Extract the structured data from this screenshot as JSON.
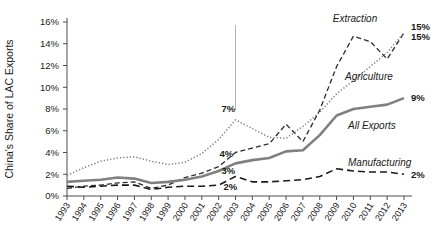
{
  "chart_data": {
    "type": "line",
    "title": "",
    "xlabel": "",
    "ylabel": "China's Share of LAC Exports",
    "x": [
      1993,
      1994,
      1995,
      1996,
      1997,
      1998,
      1999,
      2000,
      2001,
      2002,
      2003,
      2004,
      2005,
      2006,
      2007,
      2008,
      2009,
      2010,
      2011,
      2012,
      2013
    ],
    "xtick_labels": [
      "1993",
      "1994",
      "1995",
      "1996",
      "1997",
      "1998",
      "1999",
      "2000",
      "2001",
      "2002",
      "2003",
      "2004",
      "2005",
      "2006",
      "2007",
      "2008",
      "2009",
      "2010",
      "2011",
      "2012",
      "2013"
    ],
    "ytick_labels": [
      "0%",
      "2%",
      "4%",
      "6%",
      "8%",
      "10%",
      "12%",
      "14%",
      "16%"
    ],
    "ytick_values": [
      0,
      2,
      4,
      6,
      8,
      10,
      12,
      14,
      16
    ],
    "ylim": [
      0,
      16
    ],
    "xlim": [
      1993,
      2013
    ],
    "grid": false,
    "legend_position": "inline-right",
    "series": [
      {
        "name": "Extraction",
        "style": "dashed-medium",
        "color": "#2b2b2b",
        "label_text": "Extraction",
        "end_value_label": "15%",
        "values": [
          0.7,
          0.9,
          1.0,
          1.2,
          1.3,
          0.7,
          1.0,
          1.7,
          2.1,
          2.7,
          4.0,
          4.4,
          4.8,
          6.6,
          5.0,
          7.9,
          11.9,
          14.7,
          14.2,
          12.6,
          15.0
        ]
      },
      {
        "name": "Agriculture",
        "style": "dotted",
        "color": "#808080",
        "label_text": "Agriculture",
        "end_value_label": "15%",
        "values": [
          1.9,
          2.6,
          3.2,
          3.5,
          3.6,
          3.2,
          2.9,
          3.1,
          3.9,
          5.2,
          7.0,
          6.2,
          5.4,
          5.3,
          6.4,
          7.7,
          9.4,
          10.6,
          11.9,
          13.2,
          15.0
        ]
      },
      {
        "name": "All Exports",
        "style": "solid-thick",
        "color": "#808080",
        "label_text": "All Exports",
        "end_value_label": "9%",
        "values": [
          1.3,
          1.4,
          1.5,
          1.7,
          1.6,
          1.2,
          1.3,
          1.5,
          1.8,
          2.3,
          3.0,
          3.3,
          3.5,
          4.1,
          4.2,
          5.6,
          7.4,
          8.0,
          8.2,
          8.4,
          9.0
        ]
      },
      {
        "name": "Manufacturing",
        "style": "dashed-long",
        "color": "#1a1a1a",
        "label_text": "Manufacturing",
        "end_value_label": "2%",
        "values": [
          0.9,
          0.8,
          0.9,
          1.0,
          1.0,
          0.6,
          0.8,
          0.9,
          0.9,
          1.0,
          1.8,
          1.3,
          1.3,
          1.4,
          1.5,
          1.8,
          2.5,
          2.3,
          2.2,
          2.2,
          2.0
        ]
      }
    ],
    "annotations": [
      {
        "id": "agriculture-2003",
        "text": "7%",
        "x_year": 2003,
        "y_value": 7.0
      },
      {
        "id": "extraction-2003",
        "text": "4%",
        "x_year": 2003,
        "y_value": 4.0
      },
      {
        "id": "all-exports-2003",
        "text": "3%",
        "x_year": 2003,
        "y_value": 3.0
      },
      {
        "id": "manufacturing-2003",
        "text": "2%",
        "x_year": 2003,
        "y_value": 1.8
      }
    ],
    "vertical_marker": {
      "x_year": 2003,
      "y_top": 15.7,
      "y_bottom": 7.9,
      "color": "#b3b3b3"
    }
  }
}
